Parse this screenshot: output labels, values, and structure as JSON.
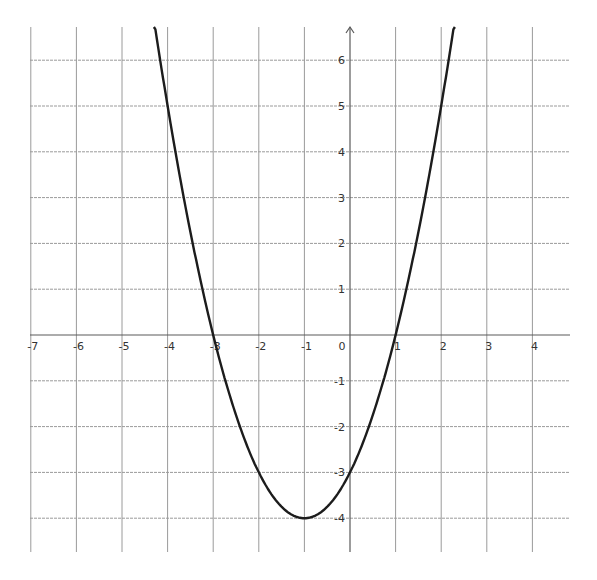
{
  "chart_data": {
    "type": "line",
    "title": "",
    "xlabel": "",
    "ylabel": "",
    "function": "y = x^2 + 2x - 3",
    "vertex": [
      -1,
      -4
    ],
    "x_intercepts": [
      -3,
      1
    ],
    "y_intercept": -3,
    "xlim": [
      -7,
      4.8
    ],
    "ylim": [
      -4.8,
      6.8
    ],
    "grid": true,
    "x_ticks": [
      -7,
      -6,
      -5,
      -4,
      -3,
      -2,
      -1,
      0,
      1,
      2,
      3,
      4
    ],
    "y_ticks": [
      -4,
      -3,
      -2,
      -1,
      1,
      2,
      3,
      4,
      5,
      6
    ],
    "x_tick_labels": [
      "-7",
      "-6",
      "-5",
      "-4",
      "-3",
      "-2",
      "-1",
      "0",
      "1",
      "2",
      "3",
      "4"
    ],
    "y_tick_labels": [
      "-4",
      "-3",
      "-2",
      "-1",
      "1",
      "2",
      "3",
      "4",
      "5",
      "6"
    ],
    "series": [
      {
        "name": "parabola",
        "x": [
          -4.3,
          -4,
          -3.5,
          -3,
          -2.5,
          -2,
          -1.5,
          -1,
          -0.5,
          0,
          0.5,
          1,
          1.5,
          2,
          2.3
        ],
        "y": [
          6.89,
          5,
          2.25,
          0,
          -1.75,
          -3,
          -3.75,
          -4,
          -3.75,
          -3,
          -1.75,
          0,
          2.25,
          5,
          6.89
        ]
      }
    ],
    "colors": {
      "curve": "#1c1c1c",
      "grid": "#9a9a9a",
      "axis": "#5a5a5a"
    },
    "legend": null
  }
}
